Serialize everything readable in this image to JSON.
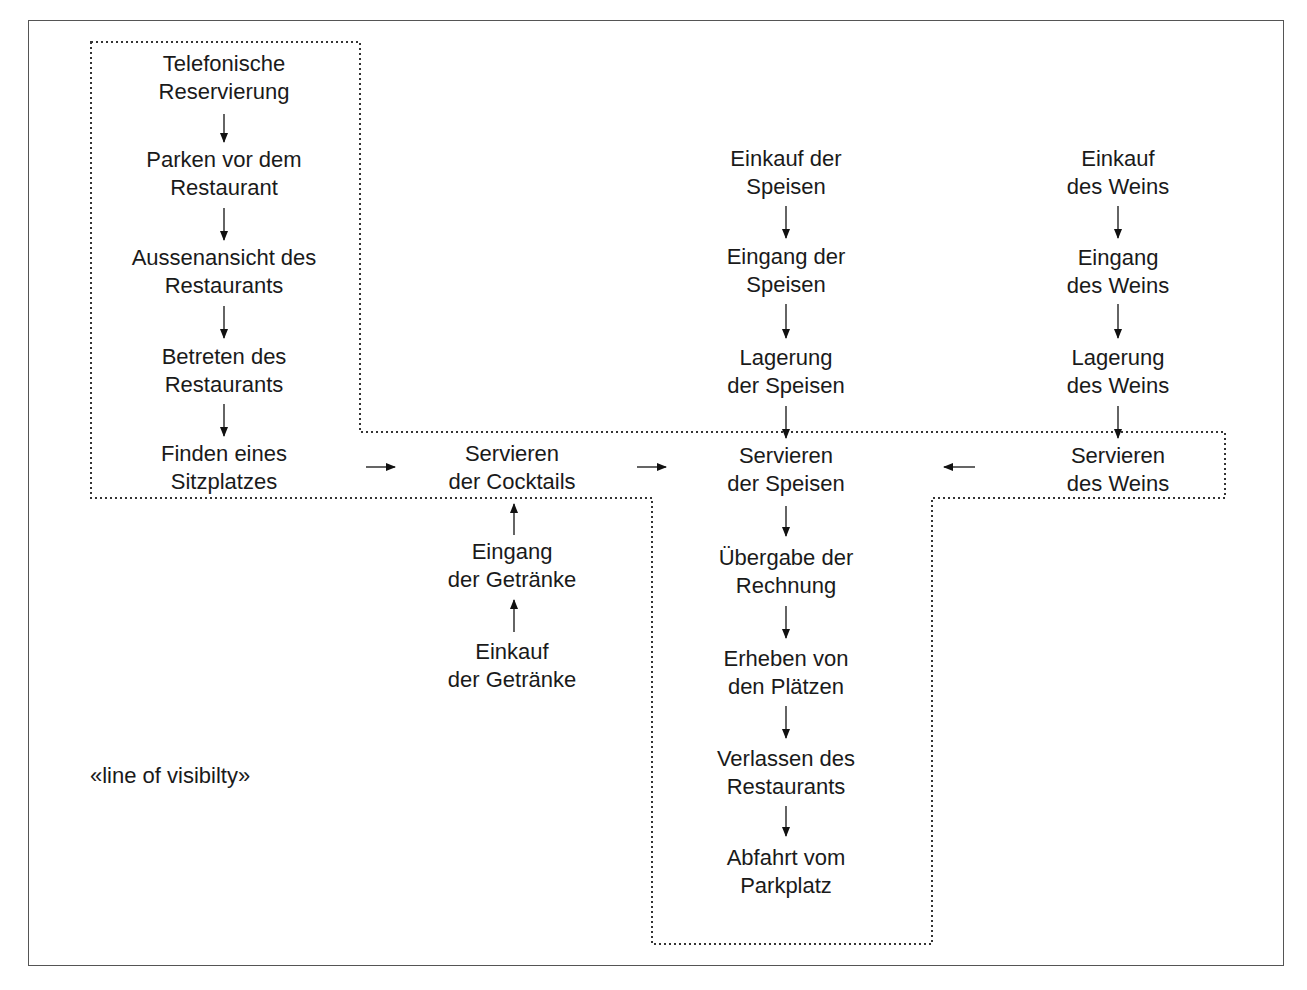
{
  "diagram": {
    "line_of_visibility_label": "«line of visibilty»",
    "nodes": {
      "telefonische_reservierung": [
        "Telefonische",
        "Reservierung"
      ],
      "parken": [
        "Parken vor dem",
        "Restaurant"
      ],
      "aussenansicht": [
        "Aussenansicht des",
        "Restaurants"
      ],
      "betreten": [
        "Betreten des",
        "Restaurants"
      ],
      "finden_sitzplatz": [
        "Finden eines",
        "Sitzplatzes"
      ],
      "servieren_cocktails": [
        "Servieren",
        "der Cocktails"
      ],
      "eingang_getraenke": [
        "Eingang",
        "der Getränke"
      ],
      "einkauf_getraenke": [
        "Einkauf",
        "der Getränke"
      ],
      "einkauf_speisen": [
        "Einkauf der",
        "Speisen"
      ],
      "eingang_speisen": [
        "Eingang der",
        "Speisen"
      ],
      "lagerung_speisen": [
        "Lagerung",
        "der Speisen"
      ],
      "servieren_speisen": [
        "Servieren",
        "der Speisen"
      ],
      "uebergabe_rechnung": [
        "Übergabe der",
        "Rechnung"
      ],
      "erheben": [
        "Erheben von",
        "den Plätzen"
      ],
      "verlassen": [
        "Verlassen des",
        "Restaurants"
      ],
      "abfahrt": [
        "Abfahrt vom",
        "Parkplatz"
      ],
      "einkauf_wein": [
        "Einkauf",
        "des Weins"
      ],
      "eingang_wein": [
        "Eingang",
        "des Weins"
      ],
      "lagerung_wein": [
        "Lagerung",
        "des Weins"
      ],
      "servieren_wein": [
        "Servieren",
        "des Weins"
      ]
    },
    "colors": {
      "text": "#1a1a1a",
      "frame": "#555555",
      "dotted_line": "#333333"
    }
  }
}
